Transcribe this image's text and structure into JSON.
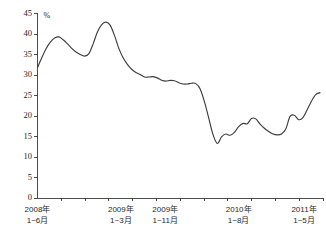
{
  "chart_data": {
    "type": "line",
    "title": "",
    "subtitle": "",
    "xlabel": "",
    "ylabel": "",
    "unit_label": "%",
    "ylim": [
      0,
      45
    ],
    "yticks": [
      0,
      5,
      10,
      15,
      20,
      25,
      30,
      35,
      40,
      45
    ],
    "ytick_labels": [
      "0",
      "5",
      "10",
      "15",
      "20",
      "25",
      "30",
      "35",
      "40",
      "45"
    ],
    "grid": false,
    "legend": null,
    "xtick_labels": [
      {
        "line1": "2008年",
        "line2": "1~6月"
      },
      {
        "line1": "2009年",
        "line2": "1~3月"
      },
      {
        "line1": "2009年",
        "line2": "1~11月"
      },
      {
        "line1": "2010年",
        "line2": "1~8月"
      },
      {
        "line1": "2011年",
        "line2": "1~5月"
      }
    ],
    "xtick_positions_frac": [
      0.0,
      0.295,
      0.452,
      0.712,
      0.985
    ],
    "series": [
      {
        "name": "series-1",
        "color": "#3d3d3d",
        "x": [
          0,
          1,
          2,
          3,
          4,
          5,
          6,
          7,
          8,
          9,
          10,
          11,
          12,
          13,
          14,
          15,
          16,
          17,
          18,
          19,
          20,
          21,
          22,
          23,
          24,
          25,
          26,
          27,
          28,
          29,
          30,
          31,
          32,
          33,
          34,
          35,
          36,
          37,
          38,
          39,
          40,
          41,
          42,
          43,
          44,
          45,
          46,
          47,
          48,
          49,
          50,
          51,
          52,
          53,
          54,
          55,
          56,
          57
        ],
        "values": [
          31.8,
          34.2,
          36.4,
          38.0,
          39.0,
          39.3,
          38.6,
          37.6,
          36.5,
          35.6,
          35.0,
          34.6,
          35.2,
          37.6,
          40.5,
          42.3,
          42.9,
          42.1,
          39.6,
          36.5,
          34.2,
          32.6,
          31.4,
          30.6,
          30.1,
          29.5,
          29.5,
          29.6,
          29.3,
          28.7,
          28.5,
          28.7,
          28.6,
          28.1,
          27.8,
          27.8,
          28.0,
          27.9,
          26.6,
          23.5,
          19.5,
          15.5,
          13.3,
          14.9,
          15.6,
          15.3,
          16.0,
          17.4,
          18.2,
          18.1,
          19.4,
          19.3,
          18.0,
          17.0,
          16.2,
          15.6,
          15.4,
          15.6
        ]
      }
    ],
    "series_tail": {
      "x": [
        58,
        59,
        60,
        61,
        62,
        63,
        64,
        65,
        66
      ],
      "values": [
        16.8,
        19.9,
        20.2,
        19.1,
        19.6,
        21.5,
        23.6,
        25.2,
        25.7
      ]
    }
  }
}
